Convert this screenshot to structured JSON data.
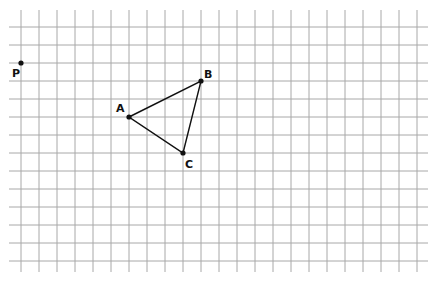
{
  "grid": {
    "origin_x": 21,
    "origin_y": 27,
    "spacing": 18,
    "x_start": 9,
    "x_end": 428,
    "y_start": 10,
    "y_end": 272,
    "cols": 23,
    "rows": 14,
    "line_color": "#a8a8a8"
  },
  "points": [
    {
      "label": "P",
      "gx": 0,
      "gy": 2,
      "label_dx": -9,
      "label_dy": 14
    },
    {
      "label": "A",
      "gx": 6,
      "gy": 5,
      "label_dx": -13,
      "label_dy": -5
    },
    {
      "label": "B",
      "gx": 10,
      "gy": 3,
      "label_dx": 3,
      "label_dy": -3
    },
    {
      "label": "C",
      "gx": 9,
      "gy": 7,
      "label_dx": 2,
      "label_dy": 15
    }
  ],
  "triangle": [
    "A",
    "B",
    "C"
  ]
}
